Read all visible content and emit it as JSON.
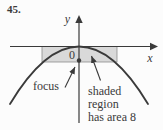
{
  "problem_number": "45.",
  "figure": {
    "axis_labels": {
      "x": "x",
      "y": "y",
      "origin": "0"
    },
    "annotations": {
      "focus_label": "focus",
      "shaded_label_lines": [
        "shaded",
        "region",
        "has area 8"
      ]
    },
    "colors": {
      "ink": "#3a3a3a",
      "shaded_fill": "#d9d9d9",
      "rect_border": "#8c8c8c",
      "background": "#fcfcfc"
    }
  }
}
